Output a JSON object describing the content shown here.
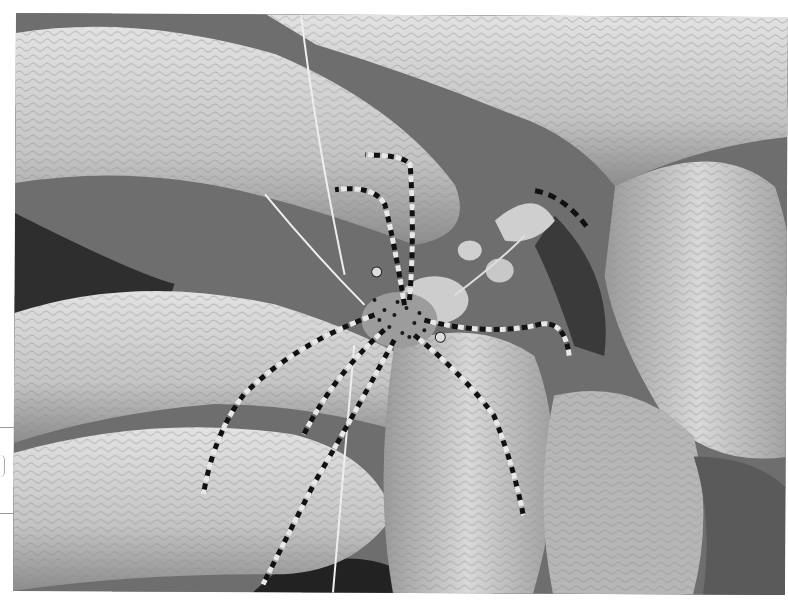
{
  "photo": {
    "subject": "spotted cleaner shrimp on sea anemone tentacles",
    "tone": "grayscale",
    "colors": {
      "background": "#ffffff",
      "tentacle_light": "#d6d6d6",
      "tentacle_mid": "#b0b0b0",
      "shadow": "#2a2a2a",
      "shrimp_spots": "#1a1a1a",
      "shrimp_body": "#bdbdbd"
    }
  }
}
